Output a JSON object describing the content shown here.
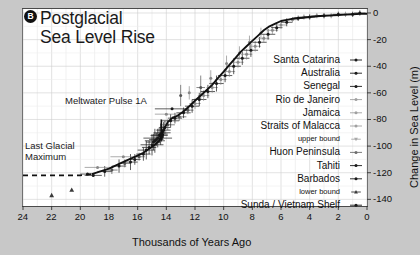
{
  "figure": {
    "panel_label": "B",
    "title_line1": "Postglacial",
    "title_line2": "Sea Level Rise"
  },
  "annotations": {
    "meltwater": "Meltwater Pulse 1A",
    "lgm_line1": "Last Glacial",
    "lgm_line2": "Maximum"
  },
  "chart_data": {
    "type": "scatter",
    "title": "Postglacial Sea Level Rise",
    "xlabel": "Thousands of Years Ago",
    "ylabel": "Change in Sea Level (m)",
    "xlim": [
      24,
      0
    ],
    "ylim": [
      -145,
      3
    ],
    "x_ticks": [
      24,
      22,
      20,
      18,
      16,
      14,
      12,
      10,
      8,
      6,
      4,
      2,
      0
    ],
    "y_ticks": [
      0,
      -20,
      -40,
      -60,
      -80,
      -100,
      -120,
      -140
    ],
    "x_minor_step": 1,
    "y_minor_step": 10,
    "grid": true,
    "legend_position": "right-inside",
    "annotations": [
      {
        "text": "Meltwater Pulse 1A",
        "x": 14.4,
        "y": -82,
        "arrow_to_y": -97
      },
      {
        "text": "Last Glacial Maximum",
        "x": 21.5,
        "y": -104
      }
    ],
    "fit_curve": {
      "name": "sea level fit",
      "color": "#111111",
      "dashed_before": 19.2,
      "x": [
        24,
        23,
        22,
        21,
        20,
        19.2,
        18.6,
        18,
        17.4,
        16.8,
        16.2,
        15.6,
        15.2,
        14.8,
        14.5,
        14.2,
        13.9,
        13.6,
        13.2,
        12.8,
        12.4,
        12.0,
        11.6,
        11.2,
        10.8,
        10.4,
        10.0,
        9.6,
        9.2,
        8.8,
        8.4,
        8.0,
        7.6,
        7.2,
        6.8,
        6.4,
        6.0,
        5.5,
        5.0,
        4.5,
        4.0,
        3.5,
        3.0,
        2.5,
        2.0,
        1.5,
        1.0,
        0.5,
        0
      ],
      "y": [
        -122,
        -122,
        -122,
        -122,
        -122,
        -121,
        -119,
        -117,
        -114,
        -111,
        -108,
        -105,
        -102,
        -99,
        -96,
        -88,
        -82,
        -79,
        -77,
        -74,
        -70,
        -66,
        -62,
        -58,
        -54,
        -49,
        -44,
        -39,
        -34,
        -29,
        -25,
        -21,
        -17,
        -13,
        -10,
        -8,
        -6,
        -5,
        -4,
        -3.5,
        -3,
        -2.5,
        -2,
        -1.8,
        -1.5,
        -1.2,
        -1,
        -0.7,
        -0.5
      ]
    },
    "series": [
      {
        "name": "Santa Catarina",
        "marker": "dot-errorbar",
        "color": "#1a1a1a"
      },
      {
        "name": "Australia",
        "marker": "dot-errorbar",
        "color": "#1a1a1a"
      },
      {
        "name": "Senegal",
        "marker": "dot-errorbar",
        "color": "#1a1a1a"
      },
      {
        "name": "Rio de Janeiro",
        "marker": "dot",
        "color": "#9a9a9a"
      },
      {
        "name": "Jamaica",
        "marker": "dot",
        "color": "#9a9a9a"
      },
      {
        "name": "Straits of Malacca",
        "marker": "dot",
        "color": "#9a9a9a"
      },
      {
        "name": "upper bound",
        "marker": "triangle-down",
        "color": "#9a9a9a",
        "small": true
      },
      {
        "name": "Huon Peninsula",
        "marker": "dot-errorbar",
        "color": "#6e6e6e"
      },
      {
        "name": "Tahiti",
        "marker": "dot-errorbar",
        "color": "#1a1a1a"
      },
      {
        "name": "Barbados",
        "marker": "dot-errorbar",
        "color": "#1a1a1a"
      },
      {
        "name": "lower bound",
        "marker": "triangle-up",
        "color": "#3a3a3a",
        "small": true
      },
      {
        "name": "Sunda / Vietnam Shelf",
        "marker": "dot-errorbar",
        "color": "#1a1a1a"
      }
    ],
    "points": [
      {
        "x": 22.0,
        "y": -137,
        "m": "triangle-up",
        "c": "#3a3a3a"
      },
      {
        "x": 20.6,
        "y": -133,
        "m": "triangle-up",
        "c": "#3a3a3a"
      },
      {
        "x": 19.1,
        "y": -122,
        "m": "dot",
        "c": "#1a1a1a",
        "ex": 0.6
      },
      {
        "x": 18.3,
        "y": -119,
        "m": "dot",
        "c": "#1a1a1a",
        "ex": 0.5,
        "ey": 4
      },
      {
        "x": 17.8,
        "y": -118,
        "m": "dot",
        "c": "#555",
        "ex": 0.4,
        "ey": 3
      },
      {
        "x": 17.3,
        "y": -115,
        "m": "dot",
        "c": "#1a1a1a",
        "ex": 0.5,
        "ey": 5
      },
      {
        "x": 16.9,
        "y": -113,
        "m": "dot",
        "c": "#555",
        "ex": 0.4,
        "ey": 3
      },
      {
        "x": 16.5,
        "y": -112,
        "m": "dot",
        "c": "#1a1a1a",
        "ex": 0.5,
        "ey": 6
      },
      {
        "x": 16.2,
        "y": -110,
        "m": "dot",
        "c": "#1a1a1a",
        "ex": 0.4,
        "ey": 4
      },
      {
        "x": 15.9,
        "y": -108,
        "m": "dot",
        "c": "#555",
        "ex": 0.4,
        "ey": 3
      },
      {
        "x": 15.6,
        "y": -106,
        "m": "dot",
        "c": "#1a1a1a",
        "ex": 0.5,
        "ey": 5
      },
      {
        "x": 15.4,
        "y": -103,
        "m": "dot",
        "c": "#1a1a1a",
        "ex": 0.6,
        "ey": 7
      },
      {
        "x": 15.2,
        "y": -101,
        "m": "dot",
        "c": "#1a1a1a",
        "ex": 0.5,
        "ey": 5
      },
      {
        "x": 15.0,
        "y": -99,
        "m": "dot",
        "c": "#1a1a1a",
        "ex": 0.8,
        "ey": 8
      },
      {
        "x": 14.9,
        "y": -97,
        "m": "dot",
        "c": "#1a1a1a",
        "ex": 0.5,
        "ey": 6
      },
      {
        "x": 14.8,
        "y": -96,
        "m": "dot",
        "c": "#1a1a1a",
        "ex": 0.7,
        "ey": 9
      },
      {
        "x": 14.7,
        "y": -95,
        "m": "dot",
        "c": "#1a1a1a",
        "ex": 0.5,
        "ey": 5
      },
      {
        "x": 14.6,
        "y": -94,
        "m": "dot",
        "c": "#1a1a1a",
        "ex": 1.0,
        "ey": 7
      },
      {
        "x": 14.5,
        "y": -92,
        "m": "dot",
        "c": "#1a1a1a",
        "ex": 0.6,
        "ey": 6
      },
      {
        "x": 14.4,
        "y": -91,
        "m": "dot",
        "c": "#1a1a1a",
        "ex": 0.5,
        "ey": 8
      },
      {
        "x": 14.3,
        "y": -90,
        "m": "dot",
        "c": "#1a1a1a",
        "ex": 0.6,
        "ey": 5
      },
      {
        "x": 14.2,
        "y": -88,
        "m": "dot",
        "c": "#1a1a1a",
        "ex": 0.5,
        "ey": 6
      },
      {
        "x": 14.1,
        "y": -86,
        "m": "dot",
        "c": "#1a1a1a",
        "ex": 0.4,
        "ey": 5
      },
      {
        "x": 13.9,
        "y": -84,
        "m": "dot",
        "c": "#555",
        "ex": 0.5,
        "ey": 4
      },
      {
        "x": 13.7,
        "y": -81,
        "m": "dot",
        "c": "#1a1a1a",
        "ex": 0.6,
        "ey": 5
      },
      {
        "x": 13.4,
        "y": -79,
        "m": "dot",
        "c": "#1a1a1a",
        "ex": 0.5,
        "ey": 4
      },
      {
        "x": 13.1,
        "y": -78,
        "m": "dot",
        "c": "#555",
        "ex": 0.5,
        "ey": 3
      },
      {
        "x": 13.6,
        "y": -72,
        "m": "dot",
        "c": "#1a1a1a",
        "ex": 1.2
      },
      {
        "x": 12.8,
        "y": -75,
        "m": "dot",
        "c": "#1a1a1a",
        "ex": 0.5,
        "ey": 4
      },
      {
        "x": 12.5,
        "y": -73,
        "m": "dot",
        "c": "#555",
        "ex": 0.4,
        "ey": 3
      },
      {
        "x": 12.2,
        "y": -70,
        "m": "dot",
        "c": "#1a1a1a",
        "ex": 0.5,
        "ey": 5
      },
      {
        "x": 12.0,
        "y": -68,
        "m": "dot",
        "c": "#888",
        "ex": 0.4,
        "ey": 4
      },
      {
        "x": 11.7,
        "y": -65,
        "m": "dot",
        "c": "#1a1a1a",
        "ex": 0.5,
        "ey": 5
      },
      {
        "x": 11.4,
        "y": -62,
        "m": "dot",
        "c": "#888",
        "ex": 0.4,
        "ey": 4
      },
      {
        "x": 11.6,
        "y": -56,
        "m": "dot",
        "c": "#555",
        "ex": 0.3,
        "ey": 9
      },
      {
        "x": 11.1,
        "y": -59,
        "m": "dot",
        "c": "#1a1a1a",
        "ex": 0.5,
        "ey": 5
      },
      {
        "x": 10.8,
        "y": -56,
        "m": "dot",
        "c": "#888",
        "ex": 0.4,
        "ey": 4
      },
      {
        "x": 10.5,
        "y": -53,
        "m": "dot",
        "c": "#1a1a1a",
        "ex": 0.5,
        "ey": 6
      },
      {
        "x": 10.2,
        "y": -50,
        "m": "dot",
        "c": "#888",
        "ex": 0.4,
        "ey": 4
      },
      {
        "x": 9.9,
        "y": -47,
        "m": "dot",
        "c": "#1a1a1a",
        "ex": 0.5,
        "ey": 5
      },
      {
        "x": 9.6,
        "y": -44,
        "m": "dot",
        "c": "#888",
        "ex": 0.4,
        "ey": 4
      },
      {
        "x": 9.3,
        "y": -40,
        "m": "dot",
        "c": "#1a1a1a",
        "ex": 0.5,
        "ey": 6
      },
      {
        "x": 9.0,
        "y": -37,
        "m": "dot",
        "c": "#888",
        "ex": 0.4,
        "ey": 4
      },
      {
        "x": 8.7,
        "y": -34,
        "m": "dot",
        "c": "#1a1a1a",
        "ex": 0.5,
        "ey": 5
      },
      {
        "x": 8.4,
        "y": -31,
        "m": "dot",
        "c": "#888",
        "ex": 0.4,
        "ey": 4
      },
      {
        "x": 8.1,
        "y": -28,
        "m": "dot",
        "c": "#1a1a1a",
        "ex": 0.5,
        "ey": 5
      },
      {
        "x": 7.8,
        "y": -25,
        "m": "dot",
        "c": "#888",
        "ex": 0.4,
        "ey": 4
      },
      {
        "x": 7.5,
        "y": -22,
        "m": "dot",
        "c": "#1a1a1a",
        "ex": 0.5,
        "ey": 4
      },
      {
        "x": 7.2,
        "y": -19,
        "m": "dot",
        "c": "#888",
        "ex": 0.4,
        "ey": 3
      },
      {
        "x": 6.9,
        "y": -16,
        "m": "dot",
        "c": "#1a1a1a",
        "ex": 0.5,
        "ey": 4
      },
      {
        "x": 6.6,
        "y": -13,
        "m": "dot",
        "c": "#888",
        "ex": 0.4,
        "ey": 3
      },
      {
        "x": 6.3,
        "y": -11,
        "m": "dot",
        "c": "#1a1a1a",
        "ex": 0.4,
        "ey": 3
      },
      {
        "x": 6.0,
        "y": -9,
        "m": "dot",
        "c": "#888",
        "ex": 0.4,
        "ey": 3
      },
      {
        "x": 5.6,
        "y": -7,
        "m": "dot",
        "c": "#1a1a1a",
        "ex": 0.4,
        "ey": 3
      },
      {
        "x": 5.2,
        "y": -5,
        "m": "dot",
        "c": "#888",
        "ex": 0.4,
        "ey": 2
      },
      {
        "x": 4.8,
        "y": -4,
        "m": "dot",
        "c": "#1a1a1a",
        "ex": 0.4,
        "ey": 2
      },
      {
        "x": 4.4,
        "y": -3,
        "m": "dot",
        "c": "#888",
        "ex": 0.4,
        "ey": 2
      },
      {
        "x": 4.0,
        "y": -3,
        "m": "dot",
        "c": "#1a1a1a",
        "ex": 0.4,
        "ey": 2
      },
      {
        "x": 3.5,
        "y": -2,
        "m": "dot",
        "c": "#888",
        "ex": 0.4,
        "ey": 2
      },
      {
        "x": 3.0,
        "y": -2,
        "m": "dot",
        "c": "#1a1a1a",
        "ex": 0.4,
        "ey": 2
      },
      {
        "x": 2.5,
        "y": -2,
        "m": "dot",
        "c": "#888",
        "ex": 0.4,
        "ey": 2
      },
      {
        "x": 2.0,
        "y": -1,
        "m": "dot",
        "c": "#1a1a1a",
        "ex": 0.4,
        "ey": 2
      },
      {
        "x": 1.5,
        "y": -1,
        "m": "dot",
        "c": "#888",
        "ex": 0.4,
        "ey": 2
      },
      {
        "x": 1.0,
        "y": -1,
        "m": "dot",
        "c": "#1a1a1a",
        "ex": 0.4,
        "ey": 2
      },
      {
        "x": 0.5,
        "y": 0,
        "m": "dot",
        "c": "#1a1a1a",
        "ex": 0.4,
        "ey": 2
      },
      {
        "x": 13.0,
        "y": -62,
        "m": "dot",
        "c": "#555",
        "ey": 8
      },
      {
        "x": 12.4,
        "y": -60,
        "m": "dot",
        "c": "#888",
        "ey": 5
      },
      {
        "x": 10.9,
        "y": -49,
        "m": "dot",
        "c": "#888",
        "ey": 6
      },
      {
        "x": 9.8,
        "y": -38,
        "m": "dot",
        "c": "#888",
        "ey": 6
      },
      {
        "x": 8.9,
        "y": -30,
        "m": "dot",
        "c": "#888",
        "ey": 5
      },
      {
        "x": 8.2,
        "y": -22,
        "m": "dot",
        "c": "#888",
        "ey": 5
      },
      {
        "x": 7.4,
        "y": -15,
        "m": "dot",
        "c": "#888",
        "ey": 4
      },
      {
        "x": 14.0,
        "y": -76,
        "m": "dot",
        "c": "#888",
        "ex": 0.8
      },
      {
        "x": 17.0,
        "y": -108,
        "m": "dot",
        "c": "#888",
        "ex": 0.9
      },
      {
        "x": 18.8,
        "y": -116,
        "m": "dot",
        "c": "#888",
        "ex": 0.9
      },
      {
        "x": 19.5,
        "y": -121,
        "m": "dot",
        "c": "#1a1a1a",
        "ex": 0.5
      }
    ]
  },
  "legend": {
    "entries": [
      {
        "label": "Santa Catarina",
        "marker": "dot-errorbar",
        "color": "#1a1a1a",
        "small": false
      },
      {
        "label": "Australia",
        "marker": "dot-errorbar",
        "color": "#1a1a1a",
        "small": false
      },
      {
        "label": "Senegal",
        "marker": "dot-errorbar",
        "color": "#1a1a1a",
        "small": false
      },
      {
        "label": "Rio de Janeiro",
        "marker": "dot",
        "color": "#a0a0a0",
        "small": false
      },
      {
        "label": "Jamaica",
        "marker": "dot",
        "color": "#a0a0a0",
        "small": false
      },
      {
        "label": "Straits of Malacca",
        "marker": "dot",
        "color": "#a0a0a0",
        "small": false
      },
      {
        "label": "upper bound",
        "marker": "triangle-down",
        "color": "#a8a8a8",
        "small": true
      },
      {
        "label": "Huon Peninsula",
        "marker": "dot-errorbar",
        "color": "#6e6e6e",
        "small": false
      },
      {
        "label": "Tahiti",
        "marker": "dot-errorbar",
        "color": "#1a1a1a",
        "small": false
      },
      {
        "label": "Barbados",
        "marker": "dot-errorbar",
        "color": "#1a1a1a",
        "small": false
      },
      {
        "label": "lower bound",
        "marker": "triangle-up",
        "color": "#3a3a3a",
        "small": true
      },
      {
        "label": "Sunda / Vietnam Shelf",
        "marker": "dot-errorbar",
        "color": "#1a1a1a",
        "small": false
      }
    ]
  }
}
